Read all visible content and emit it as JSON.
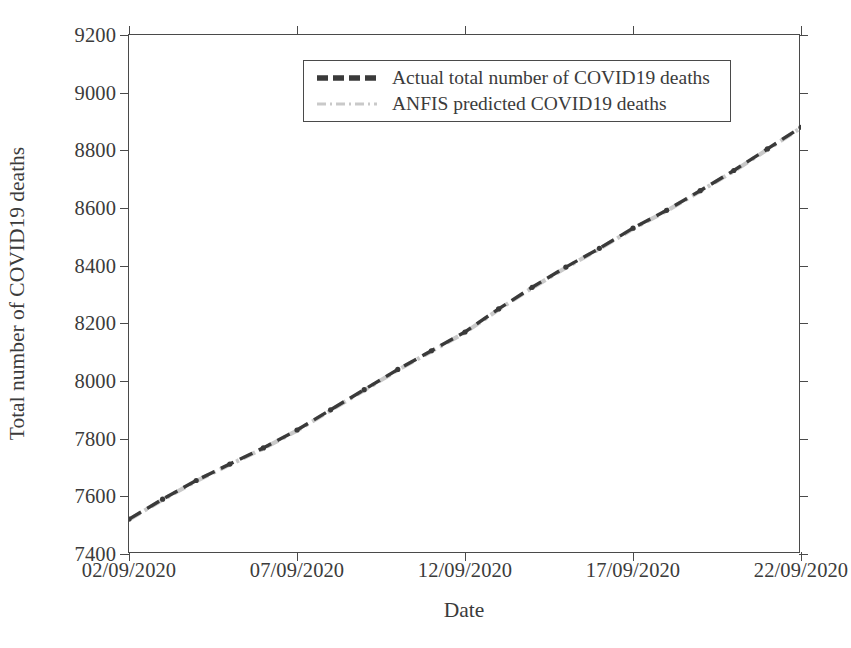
{
  "chart_data": {
    "type": "line",
    "title": "",
    "xlabel": "Date",
    "ylabel": "Total number of COVID19 deaths",
    "grid": false,
    "legend_position": "upper center",
    "ylim": [
      7400,
      9200
    ],
    "yticks": [
      7400,
      7600,
      7800,
      8000,
      8200,
      8400,
      8600,
      8800,
      9000,
      9200
    ],
    "ytick_labels": [
      "7400",
      "7600",
      "7800",
      "8000",
      "8200",
      "8400",
      "8600",
      "8800",
      "9000",
      "9200"
    ],
    "xlim": [
      "02/09/2020",
      "22/09/2020"
    ],
    "xticks": [
      "02/09/2020",
      "07/09/2020",
      "12/09/2020",
      "17/09/2020",
      "22/09/2020"
    ],
    "xtick_labels": [
      "02/09/2020",
      "07/09/2020",
      "12/09/2020",
      "17/09/2020",
      "22/09/2020"
    ],
    "x": [
      "02/09/2020",
      "03/09/2020",
      "04/09/2020",
      "05/09/2020",
      "06/09/2020",
      "07/09/2020",
      "08/09/2020",
      "09/09/2020",
      "10/09/2020",
      "11/09/2020",
      "12/09/2020",
      "13/09/2020",
      "14/09/2020",
      "15/09/2020",
      "16/09/2020",
      "17/09/2020",
      "18/09/2020",
      "19/09/2020",
      "20/09/2020",
      "21/09/2020",
      "22/09/2020"
    ],
    "series": [
      {
        "name": "Actual total number of COVID19 deaths",
        "color": "#3a3a3a",
        "style": "dashed",
        "values": [
          7521,
          7590,
          7655,
          7712,
          7768,
          7830,
          7900,
          7970,
          8040,
          8105,
          8170,
          8250,
          8325,
          8395,
          8460,
          8530,
          8592,
          8660,
          8730,
          8805,
          8880
        ]
      },
      {
        "name": "ANFIS predicted COVID19 deaths",
        "color": "#c9c9c9",
        "style": "dashdot",
        "values": [
          7519,
          7588,
          7653,
          7710,
          7766,
          7828,
          7898,
          7968,
          8038,
          8103,
          8168,
          8248,
          8323,
          8393,
          8458,
          8528,
          8590,
          8658,
          8728,
          8803,
          8878
        ]
      }
    ]
  },
  "axes": {
    "x_title": "Date",
    "y_title": "Total number of COVID19 deaths"
  },
  "legend": {
    "entries": [
      {
        "label": "Actual total number of COVID19 deaths",
        "color": "#3a3a3a",
        "style": "dashed"
      },
      {
        "label": "ANFIS predicted COVID19 deaths",
        "color": "#c9c9c9",
        "style": "dashdot"
      }
    ]
  },
  "colors": {
    "axis": "#4a4a4a",
    "text": "#3b3b3b",
    "background": "#ffffff",
    "actual": "#3a3a3a",
    "predicted": "#c9c9c9"
  }
}
